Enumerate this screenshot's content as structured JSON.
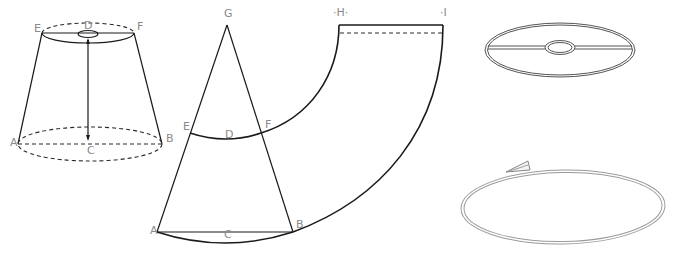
{
  "figure": {
    "panels": [
      {
        "id": "lampshade-3d",
        "description": "Tapered drum lampshade shown in perspective with top and bottom rings",
        "labels": {
          "E": "E",
          "D": "D",
          "F": "F",
          "A": "A",
          "C": "C",
          "B": "B"
        }
      },
      {
        "id": "pattern-development",
        "description": "Cone development: triangle G-A-B with arcs E-F and A-B, unrolled pattern to H-I",
        "labels": {
          "G": "G",
          "E": "E",
          "D": "D",
          "F": "F",
          "A": "A",
          "C": "C",
          "B": "B",
          "H": "·H·",
          "I": "·I"
        }
      },
      {
        "id": "top-ring",
        "description": "Top ring frame with central washer and spokes"
      },
      {
        "id": "bottom-ring",
        "description": "Bottom wire ring with clamp"
      }
    ]
  },
  "colors": {
    "line": "#1a1a1a",
    "label": "#8a8a8a",
    "wire": "#555555",
    "background": "#ffffff"
  }
}
